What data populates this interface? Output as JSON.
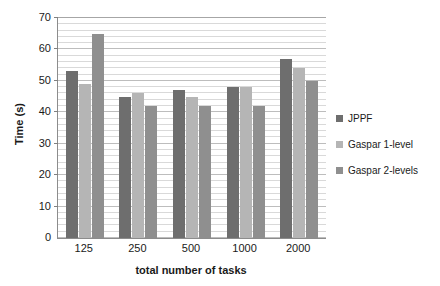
{
  "chart_data": {
    "type": "bar",
    "title": "",
    "xlabel": "total number of tasks",
    "ylabel": "Time (s)",
    "categories": [
      "125",
      "250",
      "500",
      "1000",
      "2000"
    ],
    "series": [
      {
        "name": "JPPF",
        "color": "#6e6e6e",
        "values": [
          53,
          45,
          47,
          48,
          57
        ]
      },
      {
        "name": "Gaspar 1-level",
        "color": "#b5b5b5",
        "values": [
          49,
          46,
          45,
          48,
          54
        ]
      },
      {
        "name": "Gaspar 2-levels",
        "color": "#8f8f8f",
        "values": [
          65,
          42,
          42,
          42,
          50
        ]
      }
    ],
    "ylim": [
      0,
      70
    ],
    "ytick_labels": [
      "0",
      "10",
      "20",
      "30",
      "40",
      "50",
      "60",
      "70"
    ],
    "ytick_values": [
      0,
      10,
      20,
      30,
      40,
      50,
      60,
      70
    ],
    "ytick_step": 10,
    "minor_gridline_step": 2,
    "grid": true,
    "legend_position": "right",
    "legend_entries": [
      "JPPF",
      "Gaspar 1-level",
      "Gaspar 2-levels"
    ],
    "background_color": "#ffffff",
    "axis_color": "#8c8c8c",
    "gridline_color": "#d9d9d9"
  }
}
